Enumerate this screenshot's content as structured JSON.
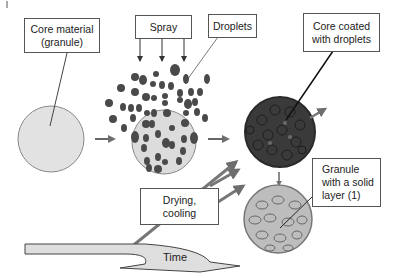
{
  "diagram": {
    "title": "",
    "corner_mark": "|",
    "labels": {
      "core_material": [
        "Core material",
        "(granule)"
      ],
      "spray": "Spray",
      "droplets": "Droplets",
      "core_coated": [
        "Core coated",
        "with droplets"
      ],
      "granule_solid_layer": [
        "Granule",
        "with a solid",
        "layer (1)"
      ],
      "drying_cooling": [
        "Drying,",
        "cooling"
      ],
      "time": "Time"
    },
    "stages": [
      {
        "name": "core-granule",
        "fill": "#e0e0e0"
      },
      {
        "name": "granule-in-spray",
        "fill": "#dcdcdc"
      },
      {
        "name": "coated-core",
        "fill": "#3a3a3a"
      },
      {
        "name": "solid-layer-granule",
        "fill": "#bdbdbd"
      }
    ],
    "colors": {
      "box_border": "#555555",
      "arrow": "#6e6e6e",
      "droplet": "#4a4a4a",
      "time_arrow_fill": "#dedede"
    }
  }
}
